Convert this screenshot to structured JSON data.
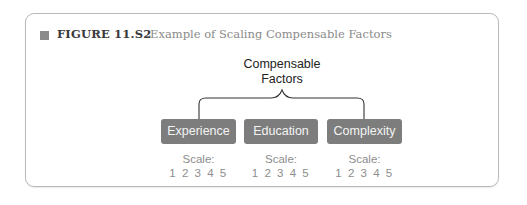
{
  "figure": {
    "number_label": "FIGURE 11.S2",
    "title": "Example of Scaling Compensable Factors"
  },
  "diagram": {
    "root": {
      "line1": "Compensable",
      "line2": "Factors"
    },
    "factors": [
      {
        "label": "Experience",
        "scale_label": "Scale:",
        "scale_values": "1 2 3 4 5"
      },
      {
        "label": "Education",
        "scale_label": "Scale:",
        "scale_values": "1 2 3 4 5"
      },
      {
        "label": "Complexity",
        "scale_label": "Scale:",
        "scale_values": "1 2 3 4 5"
      }
    ]
  },
  "colors": {
    "factor_box": "#7d7d7d",
    "factor_text": "#f4f4f4",
    "scale_text": "#8d8d8d",
    "frame_border": "#b9b9b9",
    "marker": "#8a8a8a"
  }
}
